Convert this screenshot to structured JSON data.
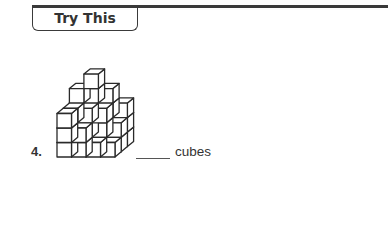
{
  "header": {
    "tab_label": "Try This"
  },
  "problem": {
    "number": "4.",
    "answer_blank": "",
    "answer_unit": "cubes"
  },
  "figure": {
    "origin": [
      57,
      157
    ],
    "cube_size": 14.5,
    "depth_offset": [
      6.2,
      -5.2
    ],
    "stroke": "#2a2a2a",
    "columns": [
      {
        "x": 0,
        "z": 2,
        "height": 4
      },
      {
        "x": 1,
        "z": 2,
        "height": 5
      },
      {
        "x": 2,
        "z": 2,
        "height": 4
      },
      {
        "x": 3,
        "z": 2,
        "height": 3
      },
      {
        "x": 0,
        "z": 1,
        "height": 3
      },
      {
        "x": 1,
        "z": 1,
        "height": 3
      },
      {
        "x": 2,
        "z": 1,
        "height": 3
      },
      {
        "x": 3,
        "z": 1,
        "height": 2
      },
      {
        "x": 0,
        "z": 0,
        "height": 3
      },
      {
        "x": 1,
        "z": 0,
        "height": 2
      },
      {
        "x": 2,
        "z": 0,
        "height": 1
      },
      {
        "x": 3,
        "z": 0,
        "height": 1
      }
    ]
  },
  "colors": {
    "line": "#3a3a3a",
    "text": "#333333",
    "face": "#ffffff"
  }
}
